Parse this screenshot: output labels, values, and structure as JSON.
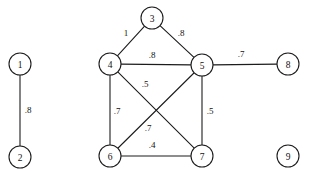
{
  "figure": {
    "name": "weighted-undirected-graph",
    "background_color": "#ffffff",
    "stroke_color": "#1c1c1c",
    "text_color": "#111111",
    "width": 316,
    "height": 171,
    "node_radius": 11
  },
  "chart_data": {
    "type": "diagram",
    "subtype": "node-link-graph",
    "title": "",
    "xlabel": "",
    "ylabel": "",
    "directed": false,
    "weighted": true,
    "node_count": 9,
    "edge_count": 10,
    "nodes": [
      {
        "id": "1",
        "label": "1",
        "x": 20,
        "y": 64
      },
      {
        "id": "2",
        "label": "2",
        "x": 20,
        "y": 157
      },
      {
        "id": "3",
        "label": "3",
        "x": 152,
        "y": 18
      },
      {
        "id": "4",
        "label": "4",
        "x": 110,
        "y": 64
      },
      {
        "id": "5",
        "label": "5",
        "x": 202,
        "y": 65
      },
      {
        "id": "6",
        "label": "6",
        "x": 110,
        "y": 156
      },
      {
        "id": "7",
        "label": "7",
        "x": 202,
        "y": 156
      },
      {
        "id": "8",
        "label": "8",
        "x": 288,
        "y": 64
      },
      {
        "id": "9",
        "label": "9",
        "x": 288,
        "y": 156
      }
    ],
    "edges": [
      {
        "source": "1",
        "target": "2",
        "weight": ".8",
        "label_x": 28,
        "label_y": 110
      },
      {
        "source": "4",
        "target": "3",
        "weight": "1",
        "label_x": 126,
        "label_y": 33
      },
      {
        "source": "3",
        "target": "5",
        "weight": ".8",
        "label_x": 181,
        "label_y": 33
      },
      {
        "source": "4",
        "target": "5",
        "weight": ".8",
        "label_x": 152,
        "label_y": 55
      },
      {
        "source": "5",
        "target": "8",
        "weight": ".7",
        "label_x": 241,
        "label_y": 54
      },
      {
        "source": "4",
        "target": "7",
        "weight": ".5",
        "label_x": 145,
        "label_y": 84
      },
      {
        "source": "4",
        "target": "6",
        "weight": ".7",
        "label_x": 117,
        "label_y": 111
      },
      {
        "source": "6",
        "target": "5",
        "weight": ".7",
        "label_x": 148,
        "label_y": 128
      },
      {
        "source": "5",
        "target": "7",
        "weight": ".5",
        "label_x": 210,
        "label_y": 111
      },
      {
        "source": "6",
        "target": "7",
        "weight": ".4",
        "label_x": 152,
        "label_y": 145
      }
    ],
    "isolated_nodes": [
      "9"
    ],
    "legend": [],
    "annotations": []
  }
}
